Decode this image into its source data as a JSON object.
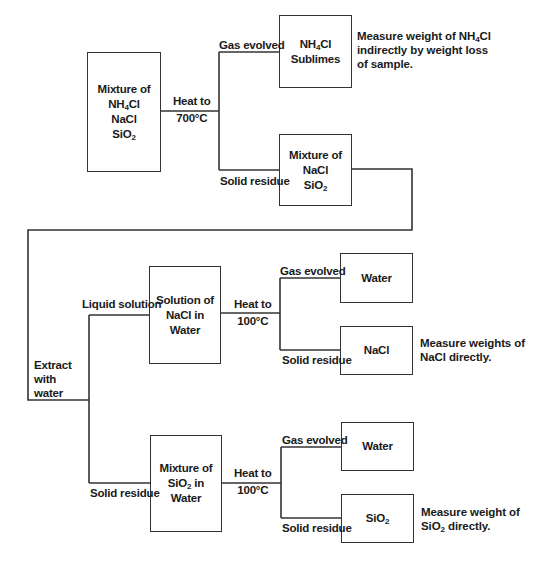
{
  "diagram": {
    "type": "flowchart",
    "title": "",
    "nodes": {
      "start": {
        "lines": [
          "Mixture of",
          "NH4Cl",
          "NaCl",
          "SiO2"
        ]
      },
      "nh4cl_sublimes": {
        "lines": [
          "NH4Cl",
          "Sublimes"
        ]
      },
      "nacl_sio2_mixture": {
        "lines": [
          "Mixture of",
          "NaCl",
          "SiO2"
        ]
      },
      "nacl_solution": {
        "lines": [
          "Solution of",
          "NaCl in",
          "Water"
        ]
      },
      "water_1": {
        "lines": [
          "Water"
        ]
      },
      "nacl_solid": {
        "lines": [
          "NaCl"
        ]
      },
      "sio2_mixture": {
        "lines": [
          "Mixture of",
          "SiO2 in",
          "Water"
        ]
      },
      "water_2": {
        "lines": [
          "Water"
        ]
      },
      "sio2_solid": {
        "lines": [
          "SiO2"
        ]
      }
    },
    "edge_labels": {
      "heat_700": [
        "Heat to",
        "700°C"
      ],
      "gas_evolved_1": "Gas evolved",
      "solid_residue_1": "Solid residue",
      "extract": [
        "Extract",
        "with",
        "water"
      ],
      "liquid_solution": "Liquid solution",
      "solid_residue_2": "Solid residue",
      "heat_100_a": [
        "Heat to",
        "100°C"
      ],
      "gas_evolved_2": "Gas evolved",
      "solid_residue_3": "Solid residue",
      "heat_100_b": [
        "Heat to",
        "100°C"
      ],
      "gas_evolved_3": "Gas evolved",
      "solid_residue_4": "Solid residue"
    },
    "notes": {
      "nh4cl": [
        "Measure weight of NH4Cl",
        "indirectly by weight loss",
        "of sample."
      ],
      "nacl": [
        "Measure weights of",
        "NaCl directly."
      ],
      "sio2": [
        "Measure weight of",
        "SiO2 directly."
      ]
    },
    "edges": [
      {
        "from": "start",
        "to": "nh4cl_sublimes",
        "label": "Heat to 700°C / Gas evolved"
      },
      {
        "from": "start",
        "to": "nacl_sio2_mixture",
        "label": "Heat to 700°C / Solid residue"
      },
      {
        "from": "nacl_sio2_mixture",
        "to": "nacl_solution",
        "label": "Extract with water / Liquid solution"
      },
      {
        "from": "nacl_sio2_mixture",
        "to": "sio2_mixture",
        "label": "Extract with water / Solid residue"
      },
      {
        "from": "nacl_solution",
        "to": "water_1",
        "label": "Heat to 100°C / Gas evolved"
      },
      {
        "from": "nacl_solution",
        "to": "nacl_solid",
        "label": "Heat to 100°C / Solid residue"
      },
      {
        "from": "sio2_mixture",
        "to": "water_2",
        "label": "Heat to 100°C / Gas evolved"
      },
      {
        "from": "sio2_mixture",
        "to": "sio2_solid",
        "label": "Heat to 100°C / Solid residue"
      }
    ]
  },
  "colors": {
    "line": "#333333",
    "text": "#1a1a1a",
    "background": "#ffffff"
  }
}
